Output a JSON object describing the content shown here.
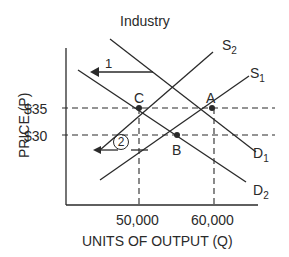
{
  "title": "Industry",
  "axes": {
    "y_label": "PRICE (P)",
    "x_label": "UNITS OF OUTPUT (Q)",
    "y_ticks": [
      "$35",
      "$30"
    ],
    "x_ticks": [
      "50,000",
      "60,000"
    ]
  },
  "curves": {
    "s2": {
      "main": "S",
      "sub": "2"
    },
    "s1": {
      "main": "S",
      "sub": "1"
    },
    "d1": {
      "main": "D",
      "sub": "1"
    },
    "d2": {
      "main": "D",
      "sub": "2"
    }
  },
  "points": {
    "a": "A",
    "b": "B",
    "c": "C"
  },
  "annotations": {
    "arrow1": "1",
    "arrow2": "2"
  },
  "colors": {
    "ink": "#2a2a2a",
    "background": "#ffffff"
  }
}
